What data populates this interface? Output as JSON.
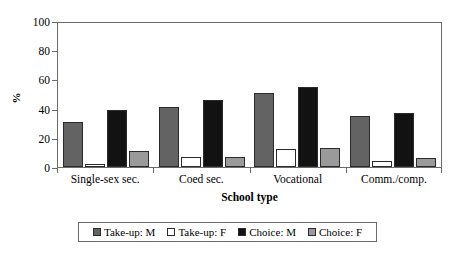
{
  "chart_data": {
    "type": "bar",
    "title": "",
    "xlabel": "School type",
    "ylabel": "%",
    "ylim": [
      0,
      100
    ],
    "yticks": [
      0,
      20,
      40,
      60,
      80,
      100
    ],
    "grid": false,
    "legend_position": "bottom",
    "categories": [
      "Single-sex sec.",
      "Coed sec.",
      "Vocational",
      "Comm./comp."
    ],
    "series": [
      {
        "name": "Take-up: M",
        "color": "#636363",
        "values": [
          31,
          41,
          51,
          35
        ]
      },
      {
        "name": "Take-up: F",
        "color": "#ffffff",
        "values": [
          2,
          7,
          12,
          4
        ]
      },
      {
        "name": "Choice: M",
        "color": "#121212",
        "values": [
          39,
          46,
          55,
          37
        ]
      },
      {
        "name": "Choice: F",
        "color": "#9a9a9a",
        "values": [
          11,
          7,
          13,
          6
        ]
      }
    ]
  }
}
